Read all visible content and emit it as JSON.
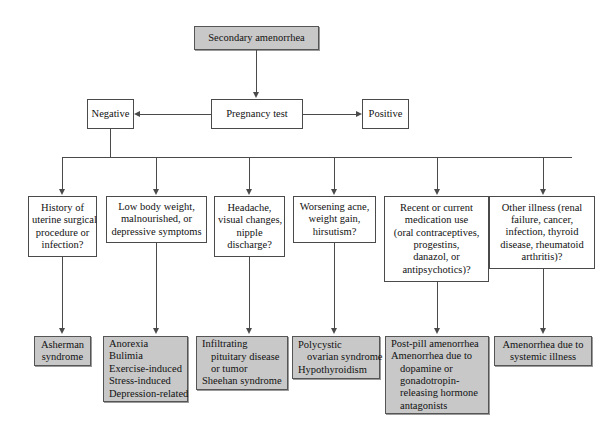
{
  "diagram": {
    "root": {
      "label": "Secondary amenorrhea"
    },
    "decision": {
      "label": "Pregnancy test"
    },
    "outcomes": {
      "negative": "Negative",
      "positive": "Positive"
    },
    "questions": [
      {
        "id": "q1",
        "lines": [
          "History of",
          "uterine surgical",
          "procedure or",
          "infection?"
        ]
      },
      {
        "id": "q2",
        "lines": [
          "Low body weight,",
          "malnourished, or",
          "depressive symptoms"
        ]
      },
      {
        "id": "q3",
        "lines": [
          "Headache,",
          "visual changes,",
          "nipple",
          "discharge?"
        ]
      },
      {
        "id": "q4",
        "lines": [
          "Worsening acne,",
          "weight gain,",
          "hirsutism?"
        ]
      },
      {
        "id": "q5",
        "lines": [
          "Recent or current",
          "medication use",
          "(oral contraceptives,",
          "progestins,",
          "danazol, or",
          "antipsychotics)?"
        ]
      },
      {
        "id": "q6",
        "lines": [
          "Other illness (renal",
          "failure, cancer,",
          "infection, thyroid",
          "disease, rheumatoid",
          "arthritis)?"
        ]
      }
    ],
    "diagnoses": [
      {
        "id": "d1",
        "align": "center",
        "lines": [
          {
            "text": "Asherman",
            "indent": false
          },
          {
            "text": "syndrome",
            "indent": false
          }
        ]
      },
      {
        "id": "d2",
        "align": "left",
        "lines": [
          {
            "text": "Anorexia",
            "indent": false
          },
          {
            "text": "Bulimia",
            "indent": false
          },
          {
            "text": "Exercise-induced",
            "indent": false
          },
          {
            "text": "Stress-induced",
            "indent": false
          },
          {
            "text": "Depression-related",
            "indent": false
          }
        ]
      },
      {
        "id": "d3",
        "align": "left",
        "lines": [
          {
            "text": "Infiltrating",
            "indent": false
          },
          {
            "text": "pituitary disease",
            "indent": true
          },
          {
            "text": "or tumor",
            "indent": true
          },
          {
            "text": "Sheehan syndrome",
            "indent": false
          }
        ]
      },
      {
        "id": "d4",
        "align": "left",
        "lines": [
          {
            "text": "Polycystic",
            "indent": false
          },
          {
            "text": "ovarian syndrome",
            "indent": true
          },
          {
            "text": "Hypothyroidism",
            "indent": false
          }
        ]
      },
      {
        "id": "d5",
        "align": "left",
        "lines": [
          {
            "text": "Post-pill amenorrhea",
            "indent": false
          },
          {
            "text": "Amenorrhea due to",
            "indent": false
          },
          {
            "text": "dopamine or",
            "indent": true
          },
          {
            "text": "gonadotropin-",
            "indent": true
          },
          {
            "text": "releasing hormone",
            "indent": true
          },
          {
            "text": "antagonists",
            "indent": true
          }
        ]
      },
      {
        "id": "d6",
        "align": "center",
        "lines": [
          {
            "text": "Amenorrhea due to",
            "indent": false
          },
          {
            "text": "systemic illness",
            "indent": false
          }
        ]
      }
    ],
    "colors": {
      "shaded_fill": "#c8c8c8",
      "box_border": "#4a4a4a",
      "connector": "#4a4a4a",
      "background": "#ffffff",
      "text": "#111111"
    }
  }
}
